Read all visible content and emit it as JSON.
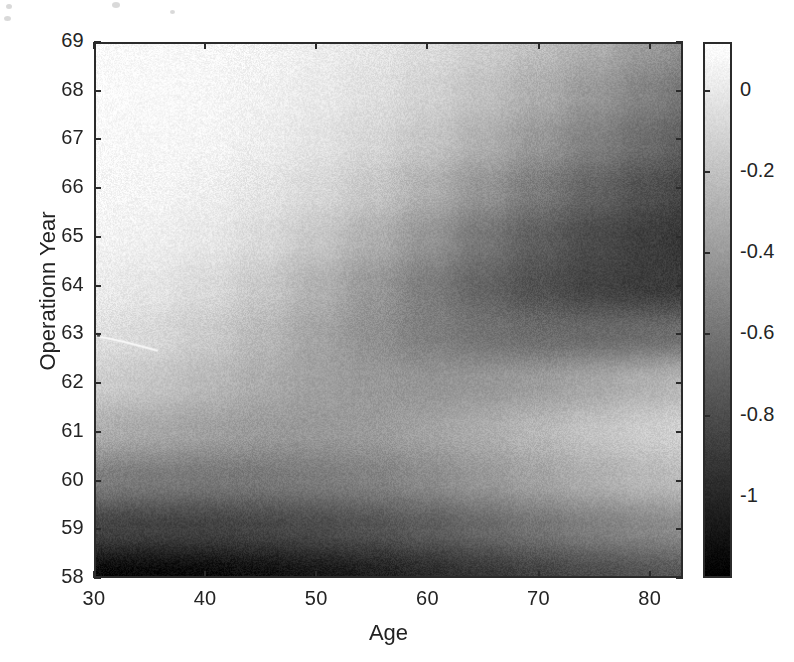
{
  "figure": {
    "background": "#ffffff",
    "axis_color": "#2b2b2b",
    "text_color": "#242424"
  },
  "axes": {
    "x": {
      "label": "Age",
      "ticks": [
        "30",
        "40",
        "50",
        "60",
        "70",
        "80"
      ],
      "tick_values": [
        30,
        40,
        50,
        60,
        70,
        80
      ],
      "range": [
        30,
        83
      ]
    },
    "y": {
      "label": "Operationn Year",
      "ticks": [
        "69",
        "68",
        "67",
        "66",
        "65",
        "64",
        "63",
        "62",
        "61",
        "60",
        "59",
        "58"
      ],
      "tick_values": [
        69,
        68,
        67,
        66,
        65,
        64,
        63,
        62,
        61,
        60,
        59,
        58
      ],
      "range": [
        58,
        69
      ]
    }
  },
  "colorbar": {
    "ticks": [
      "0",
      "-0.2",
      "-0.4",
      "-0.6",
      "-0.8",
      "-1"
    ],
    "tick_values": [
      0,
      -0.2,
      -0.4,
      -0.6,
      -0.8,
      -1
    ],
    "range": [
      -1.2,
      0.12
    ],
    "colormap": "gray",
    "orientation": "vertical",
    "position": "right"
  },
  "chart_data": {
    "type": "heatmap",
    "title": "",
    "xlabel": "Age",
    "ylabel": "Operationn Year",
    "colorbar_label": "",
    "colormap": "gray",
    "grid": false,
    "legend": "none",
    "xlim": [
      30,
      83
    ],
    "ylim": [
      58,
      69
    ],
    "zlim": [
      -1.2,
      0.12
    ],
    "x": [
      30,
      35,
      40,
      45,
      50,
      55,
      60,
      65,
      70,
      75,
      80,
      83
    ],
    "y": [
      58,
      59,
      60,
      61,
      62,
      63,
      64,
      65,
      66,
      67,
      68,
      69
    ],
    "xtick_labels": [
      "30",
      "40",
      "50",
      "60",
      "70",
      "80"
    ],
    "ytick_labels": [
      "58",
      "59",
      "60",
      "61",
      "62",
      "63",
      "64",
      "65",
      "66",
      "67",
      "68",
      "69"
    ],
    "colorbar_ticks": [
      "0",
      "-0.2",
      "-0.4",
      "-0.6",
      "-0.8",
      "-1"
    ],
    "z_rows_top_to_bottom": [
      {
        "y": 69,
        "values": [
          0.1,
          0.09,
          0.08,
          0.06,
          0.03,
          -0.01,
          -0.06,
          -0.13,
          -0.21,
          -0.3,
          -0.4,
          -0.45
        ]
      },
      {
        "y": 68,
        "values": [
          0.1,
          0.09,
          0.08,
          0.05,
          0.01,
          -0.04,
          -0.11,
          -0.2,
          -0.3,
          -0.41,
          -0.52,
          -0.58
        ]
      },
      {
        "y": 67,
        "values": [
          0.09,
          0.08,
          0.07,
          0.03,
          -0.02,
          -0.09,
          -0.18,
          -0.29,
          -0.41,
          -0.53,
          -0.64,
          -0.7
        ]
      },
      {
        "y": 66,
        "values": [
          0.08,
          0.07,
          0.04,
          -0.01,
          -0.08,
          -0.17,
          -0.29,
          -0.43,
          -0.56,
          -0.68,
          -0.78,
          -0.83
        ]
      },
      {
        "y": 65,
        "values": [
          0.06,
          0.04,
          0.0,
          -0.07,
          -0.17,
          -0.29,
          -0.43,
          -0.58,
          -0.71,
          -0.81,
          -0.88,
          -0.91
        ]
      },
      {
        "y": 64,
        "values": [
          0.02,
          -0.01,
          -0.07,
          -0.16,
          -0.28,
          -0.41,
          -0.55,
          -0.68,
          -0.78,
          -0.85,
          -0.89,
          -0.9
        ]
      },
      {
        "y": 63,
        "values": [
          -0.04,
          -0.08,
          -0.15,
          -0.24,
          -0.35,
          -0.45,
          -0.54,
          -0.6,
          -0.64,
          -0.65,
          -0.64,
          -0.63
        ]
      },
      {
        "y": 62,
        "values": [
          -0.14,
          -0.18,
          -0.24,
          -0.31,
          -0.37,
          -0.41,
          -0.43,
          -0.42,
          -0.39,
          -0.34,
          -0.29,
          -0.26
        ]
      },
      {
        "y": 61,
        "values": [
          -0.3,
          -0.33,
          -0.37,
          -0.4,
          -0.41,
          -0.4,
          -0.36,
          -0.31,
          -0.25,
          -0.19,
          -0.14,
          -0.12
        ]
      },
      {
        "y": 60,
        "values": [
          -0.55,
          -0.57,
          -0.58,
          -0.58,
          -0.56,
          -0.53,
          -0.48,
          -0.42,
          -0.36,
          -0.3,
          -0.25,
          -0.23
        ]
      },
      {
        "y": 59,
        "values": [
          -0.85,
          -0.86,
          -0.86,
          -0.84,
          -0.81,
          -0.77,
          -0.72,
          -0.66,
          -0.6,
          -0.54,
          -0.5,
          -0.48
        ]
      },
      {
        "y": 58,
        "values": [
          -1.16,
          -1.16,
          -1.15,
          -1.12,
          -1.08,
          -1.04,
          -0.98,
          -0.92,
          -0.86,
          -0.81,
          -0.77,
          -0.75
        ]
      }
    ]
  },
  "artifacts": {
    "scratch_description": "thin bright scan scratch near age 31-36 at operation year ~62.8"
  }
}
